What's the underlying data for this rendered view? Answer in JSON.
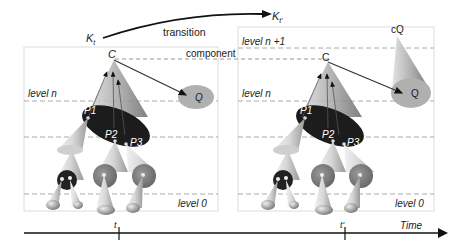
{
  "top": {
    "k_left": "K",
    "k_left_sub": "t",
    "k_right": "K",
    "k_right_sub": "t'",
    "transition_label": "transition",
    "component_label": "component"
  },
  "left_panel": {
    "level_n": "level n",
    "level_0": "level 0",
    "node_c": "C",
    "node_q": "Q",
    "p1": "P1",
    "p2": "P2",
    "p3": "P3"
  },
  "right_panel": {
    "level_n1": "level n +1",
    "level_n": "level n",
    "level_0": "level 0",
    "node_c": "C",
    "node_cq": "cQ",
    "node_q": "Q",
    "p1": "P1",
    "p2": "P2",
    "p3": "P3"
  },
  "timeline": {
    "t_left": "t",
    "t_right": "t'",
    "axis_label": "Time"
  },
  "colors": {
    "dark_ellipse": "#1a1a1a",
    "gray_disk": "#8a8a8a",
    "q_ellipse": "#b5b5b5",
    "dashed": "#aaaaaa",
    "panel_border": "#dddddd"
  }
}
